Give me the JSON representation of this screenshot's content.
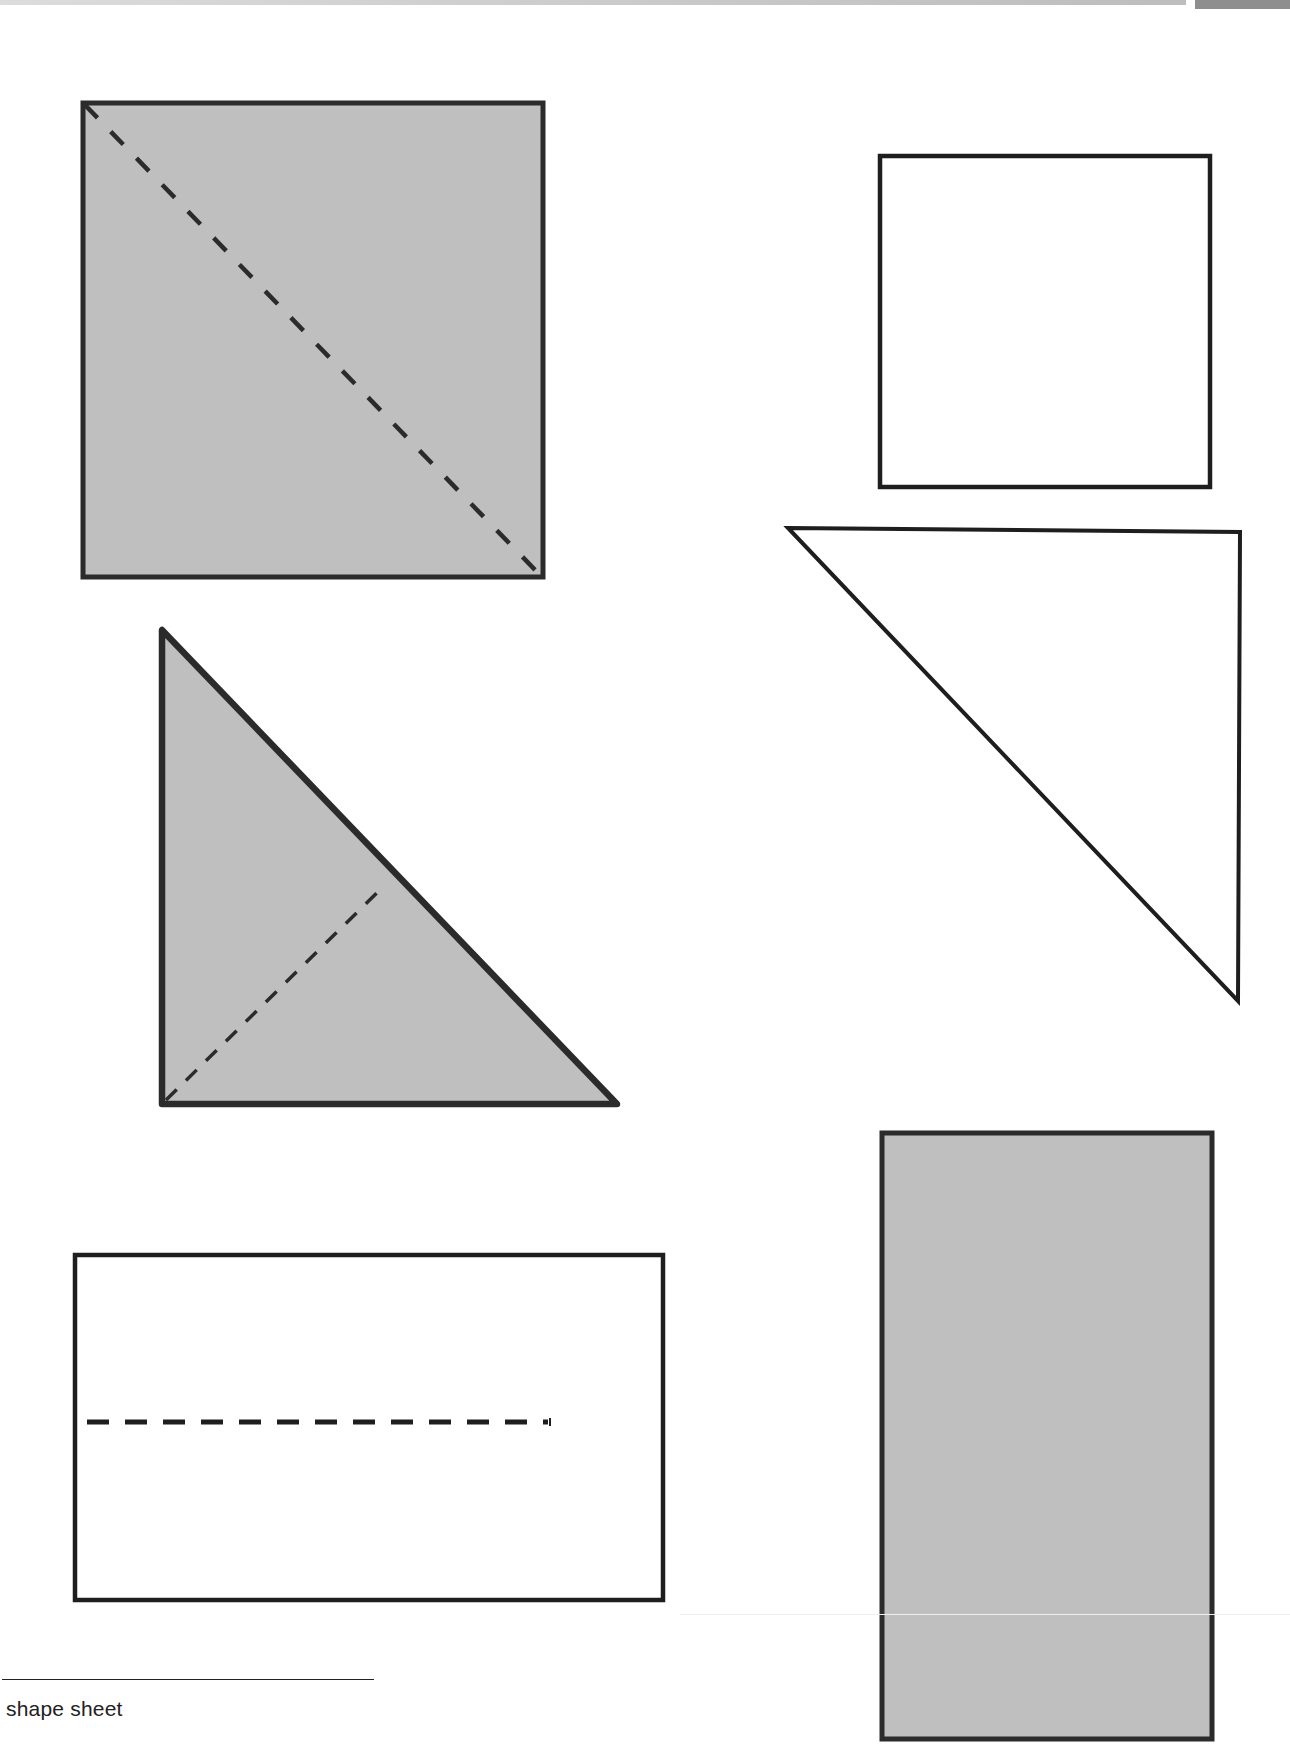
{
  "page": {
    "footnote": "shape sheet"
  },
  "colors": {
    "shaded_fill": "#bfbfbf",
    "outline": "#2b2b2b",
    "unshaded_fill": "#ffffff",
    "fold_line": "#333333"
  },
  "shapes": [
    {
      "id": "large-square",
      "type": "square",
      "shaded": true,
      "fold_line": "dashed diagonal (top-left to bottom-right)"
    },
    {
      "id": "small-square",
      "type": "square",
      "shaded": false,
      "fold_line": "none"
    },
    {
      "id": "shaded-right-triangle",
      "type": "right-triangle",
      "shaded": true,
      "fold_line": "dashed altitude from right-angle corner to hypotenuse"
    },
    {
      "id": "unshaded-right-triangle",
      "type": "right-triangle",
      "shaded": false,
      "fold_line": "none"
    },
    {
      "id": "wide-rectangle",
      "type": "rectangle",
      "shaded": false,
      "fold_line": "dashed horizontal midline"
    },
    {
      "id": "tall-rectangle",
      "type": "rectangle",
      "shaded": true,
      "fold_line": "none"
    }
  ]
}
